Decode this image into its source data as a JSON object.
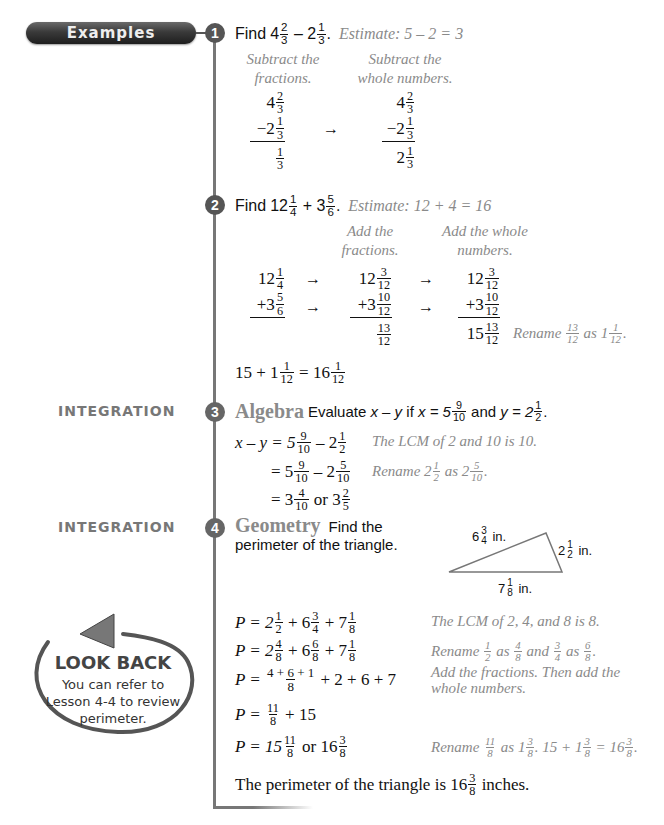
{
  "header": {
    "pill_label": "Examples"
  },
  "sidebar": {
    "integration_label_3": "INTEGRATION",
    "integration_label_4": "INTEGRATION",
    "look_back": {
      "title": "LOOK BACK",
      "line1": "You can refer to",
      "line2": "Lesson 4-4 to review",
      "line3": "perimeter."
    }
  },
  "examples": [
    {
      "number": "1",
      "prompt": "Find",
      "problem": {
        "a_whole": "4",
        "a_num": "2",
        "a_den": "3",
        "op": "–",
        "b_whole": "2",
        "b_num": "1",
        "b_den": "3",
        "end": "."
      },
      "estimate": "Estimate: 5 – 2 = 3",
      "step1_label_1": "Subtract the",
      "step1_label_2": "fractions.",
      "step2_label_1": "Subtract the",
      "step2_label_2": "whole numbers.",
      "col1": {
        "top": "4",
        "top_n": "2",
        "top_d": "3",
        "mid": "−2",
        "mid_n": "1",
        "mid_d": "3",
        "res_n": "1",
        "res_d": "3"
      },
      "col2": {
        "top": "4",
        "top_n": "2",
        "top_d": "3",
        "mid": "−2",
        "mid_n": "1",
        "mid_d": "3",
        "res": "2",
        "res_n": "1",
        "res_d": "3"
      },
      "arrow": "→"
    },
    {
      "number": "2",
      "prompt": "Find",
      "problem": {
        "a_whole": "12",
        "a_num": "1",
        "a_den": "4",
        "op": "+",
        "b_whole": "3",
        "b_num": "5",
        "b_den": "6",
        "end": "."
      },
      "estimate": "Estimate: 12 + 4 = 16",
      "step1_label_1": "Add the",
      "step1_label_2": "fractions.",
      "step2_label_1": "Add the whole",
      "step2_label_2": "numbers.",
      "col1": {
        "top": "12",
        "top_n": "1",
        "top_d": "4",
        "mid": "+3",
        "mid_n": "5",
        "mid_d": "6"
      },
      "col2": {
        "top": "12",
        "top_n": "3",
        "top_d": "12",
        "mid": "+3",
        "mid_n": "10",
        "mid_d": "12",
        "res_n": "13",
        "res_d": "12"
      },
      "col3": {
        "top": "12",
        "top_n": "3",
        "top_d": "12",
        "mid": "+3",
        "mid_n": "10",
        "mid_d": "12",
        "res": "15",
        "res_n": "13",
        "res_d": "12"
      },
      "arrow": "→",
      "rename_note": {
        "word": "Rename",
        "f_n": "13",
        "f_d": "12",
        "as": "as",
        "w": "1",
        "w_n": "1",
        "w_d": "12",
        "end": "."
      },
      "final": {
        "a": "15 + 1",
        "a_n": "1",
        "a_d": "12",
        "eq": "= 16",
        "b_n": "1",
        "b_d": "12"
      }
    },
    {
      "number": "3",
      "topic": "Algebra",
      "prompt_pre": "Evaluate",
      "prompt_expr": "x – y",
      "prompt_if": "if",
      "x_label": "x = 5",
      "x_n": "9",
      "x_d": "10",
      "and": "and",
      "y_label": "y = 2",
      "y_n": "1",
      "y_d": "2",
      "end": ".",
      "lines": [
        {
          "lhs": "x – y = 5",
          "a_n": "9",
          "a_d": "10",
          "mid": "– 2",
          "b_n": "1",
          "b_d": "2",
          "note": "The LCM of 2 and 10 is 10."
        },
        {
          "lhs": "= 5",
          "a_n": "9",
          "a_d": "10",
          "mid": "– 2",
          "b_n": "5",
          "b_d": "10",
          "note_word": "Rename 2",
          "note_a_n": "1",
          "note_a_d": "2",
          "note_as": "as 2",
          "note_b_n": "5",
          "note_b_d": "10",
          "note_end": "."
        },
        {
          "lhs": "= 3",
          "a_n": "4",
          "a_d": "10",
          "mid": "or 3",
          "b_n": "2",
          "b_d": "5"
        }
      ]
    },
    {
      "number": "4",
      "topic": "Geometry",
      "prompt_1": "Find the",
      "prompt_2": "perimeter of the triangle.",
      "triangle": {
        "side_top": {
          "w": "6",
          "n": "3",
          "d": "4",
          "unit": "in."
        },
        "side_right": {
          "w": "2",
          "n": "1",
          "d": "2",
          "unit": "in."
        },
        "side_bottom": {
          "w": "7",
          "n": "1",
          "d": "8",
          "unit": "in."
        }
      },
      "lines": [
        {
          "p": "P = 2",
          "a_n": "1",
          "a_d": "2",
          "b": "+ 6",
          "b_n": "3",
          "b_d": "4",
          "c": "+ 7",
          "c_n": "1",
          "c_d": "8",
          "note": "The LCM of 2, 4, and 8 is 8."
        },
        {
          "p": "P = 2",
          "a_n": "4",
          "a_d": "8",
          "b": "+ 6",
          "b_n": "6",
          "b_d": "8",
          "c": "+ 7",
          "c_n": "1",
          "c_d": "8",
          "note_word": "Rename",
          "n1_n": "1",
          "n1_d": "2",
          "n_as": "as",
          "n2_n": "4",
          "n2_d": "8",
          "n_and": "and",
          "n3_n": "3",
          "n3_d": "4",
          "n_as2": "as",
          "n4_n": "6",
          "n4_d": "8",
          "n_end": "."
        },
        {
          "p": "P =",
          "frac_n": "4 + 6 + 1",
          "frac_d": "8",
          "rest": "+ 2 + 6 + 7",
          "note_1": "Add the fractions. Then add the",
          "note_2": "whole numbers."
        },
        {
          "p": "P =",
          "frac_n": "11",
          "frac_d": "8",
          "rest": "+ 15"
        },
        {
          "p": "P = 15",
          "a_n": "11",
          "a_d": "8",
          "mid": "or 16",
          "b_n": "3",
          "b_d": "8",
          "note_word": "Rename",
          "r1_n": "11",
          "r1_d": "8",
          "r_as": "as 1",
          "r2_n": "3",
          "r2_d": "8",
          "r_mid": ". 15 + 1",
          "r3_n": "3",
          "r3_d": "8",
          "r_eq": "= 16",
          "r4_n": "3",
          "r4_d": "8",
          "r_end": "."
        }
      ],
      "conclusion_pre": "The perimeter of the triangle is 16",
      "conclusion_n": "3",
      "conclusion_d": "8",
      "conclusion_post": "inches."
    }
  ]
}
